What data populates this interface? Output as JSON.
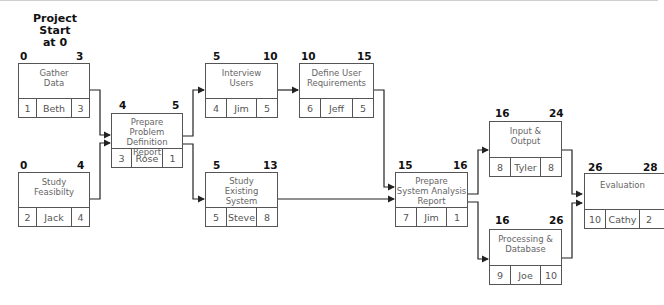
{
  "diagram": {
    "type": "PERT / network diagram",
    "start_label": "Project Start at 0",
    "start_label_lines": [
      "Project",
      "Start",
      "at 0"
    ],
    "tasks": [
      {
        "id": "1",
        "title_lines": [
          "Gather",
          "Data"
        ],
        "owner": "Beth",
        "duration": "3",
        "earliest_start": "0",
        "earliest_finish": "3"
      },
      {
        "id": "2",
        "title_lines": [
          "Study",
          "Feasibilty"
        ],
        "owner": "Jack",
        "duration": "4",
        "earliest_start": "0",
        "earliest_finish": "4"
      },
      {
        "id": "3",
        "title_lines": [
          "Prepare",
          "Problem Definition",
          "Report"
        ],
        "owner": "Rose",
        "duration": "1",
        "earliest_start": "4",
        "earliest_finish": "5"
      },
      {
        "id": "4",
        "title_lines": [
          "Interview",
          "Users"
        ],
        "owner": "Jim",
        "duration": "5",
        "earliest_start": "5",
        "earliest_finish": "10"
      },
      {
        "id": "5",
        "title_lines": [
          "Study",
          "Existing",
          "System"
        ],
        "owner": "Steve",
        "duration": "8",
        "earliest_start": "5",
        "earliest_finish": "13"
      },
      {
        "id": "6",
        "title_lines": [
          "Define User",
          "Requirements"
        ],
        "owner": "Jeff",
        "duration": "5",
        "earliest_start": "10",
        "earliest_finish": "15"
      },
      {
        "id": "7",
        "title_lines": [
          "Prepare",
          "System Analysis",
          "Report"
        ],
        "owner": "Jim",
        "duration": "1",
        "earliest_start": "15",
        "earliest_finish": "16"
      },
      {
        "id": "8",
        "title_lines": [
          "Input &",
          "Output"
        ],
        "owner": "Tyler",
        "duration": "8",
        "earliest_start": "16",
        "earliest_finish": "24"
      },
      {
        "id": "9",
        "title_lines": [
          "Processing &",
          "Database"
        ],
        "owner": "Joe",
        "duration": "10",
        "earliest_start": "16",
        "earliest_finish": "26"
      },
      {
        "id": "10",
        "title_lines": [
          "Evaluation"
        ],
        "owner": "Cathy",
        "duration": "2",
        "earliest_start": "26",
        "earliest_finish": "28"
      }
    ],
    "dependencies": [
      {
        "from": "1",
        "to": "3"
      },
      {
        "from": "2",
        "to": "3"
      },
      {
        "from": "3",
        "to": "4"
      },
      {
        "from": "3",
        "to": "5"
      },
      {
        "from": "4",
        "to": "6"
      },
      {
        "from": "6",
        "to": "7"
      },
      {
        "from": "5",
        "to": "7"
      },
      {
        "from": "7",
        "to": "8"
      },
      {
        "from": "7",
        "to": "9"
      },
      {
        "from": "8",
        "to": "10"
      },
      {
        "from": "9",
        "to": "10"
      }
    ],
    "colors": {
      "line": "#222222",
      "box_border": "#555555",
      "text": "#666666",
      "numbers": "#111111"
    }
  }
}
